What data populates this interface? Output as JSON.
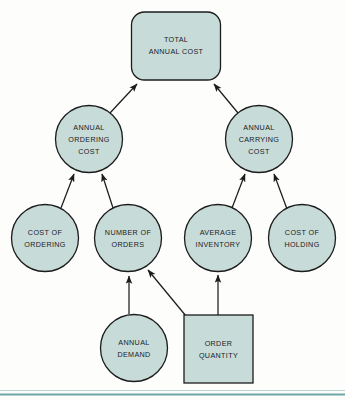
{
  "diagram": {
    "colors": {
      "node_fill": "#c7dcd8",
      "node_stroke": "#1c1c1c",
      "text": "#20201f",
      "background": "#fdfdfc",
      "rule": "#6fa6a3"
    },
    "nodes": [
      {
        "id": "total-annual-cost",
        "shape": "rounded-rect",
        "lines": [
          "TOTAL",
          "ANNUAL  COST"
        ],
        "x": 176,
        "y": 46,
        "width": 89,
        "height": 68
      },
      {
        "id": "annual-ordering-cost",
        "shape": "circle",
        "lines": [
          "ANNUAL",
          "ORDERING",
          "COST"
        ],
        "x": 89,
        "y": 139,
        "r": 33.5
      },
      {
        "id": "annual-carrying-cost",
        "shape": "circle",
        "lines": [
          "ANNUAL",
          "CARRYING",
          "COST"
        ],
        "x": 259,
        "y": 139,
        "r": 33.5
      },
      {
        "id": "cost-of-ordering",
        "shape": "circle",
        "lines": [
          "COST OF",
          "ORDERING"
        ],
        "x": 45,
        "y": 238,
        "r": 33.5
      },
      {
        "id": "number-of-orders",
        "shape": "circle",
        "lines": [
          "NUMBER OF",
          "ORDERS"
        ],
        "x": 128,
        "y": 238,
        "r": 33.5
      },
      {
        "id": "average-inventory",
        "shape": "circle",
        "lines": [
          "AVERAGE",
          "INVENTORY"
        ],
        "x": 218,
        "y": 238,
        "r": 33.5
      },
      {
        "id": "cost-of-holding",
        "shape": "circle",
        "lines": [
          "COST OF",
          "HOLDING"
        ],
        "x": 302,
        "y": 238,
        "r": 33.5
      },
      {
        "id": "annual-demand",
        "shape": "circle",
        "lines": [
          "ANNUAL",
          "DEMAND"
        ],
        "x": 134,
        "y": 348,
        "r": 33.5
      },
      {
        "id": "order-quantity",
        "shape": "rect",
        "lines": [
          "ORDER",
          "QUANTITY"
        ],
        "x": 218,
        "y": 349,
        "width": 69,
        "height": 68
      }
    ],
    "edges": [
      {
        "id": "edge-ordering-to-total",
        "from": "annual-ordering-cost",
        "to": "total-annual-cost"
      },
      {
        "id": "edge-carrying-to-total",
        "from": "annual-carrying-cost",
        "to": "total-annual-cost"
      },
      {
        "id": "edge-cost-of-ordering-to-ordering",
        "from": "cost-of-ordering",
        "to": "annual-ordering-cost"
      },
      {
        "id": "edge-number-of-orders-to-ordering",
        "from": "number-of-orders",
        "to": "annual-ordering-cost"
      },
      {
        "id": "edge-average-inventory-to-carrying",
        "from": "average-inventory",
        "to": "annual-carrying-cost"
      },
      {
        "id": "edge-cost-of-holding-to-carrying",
        "from": "cost-of-holding",
        "to": "annual-carrying-cost"
      },
      {
        "id": "edge-annual-demand-to-number-of-orders",
        "from": "annual-demand",
        "to": "number-of-orders"
      },
      {
        "id": "edge-order-quantity-to-number-of-orders",
        "from": "order-quantity",
        "to": "number-of-orders"
      },
      {
        "id": "edge-order-quantity-to-average-inventory",
        "from": "order-quantity",
        "to": "average-inventory"
      }
    ]
  }
}
